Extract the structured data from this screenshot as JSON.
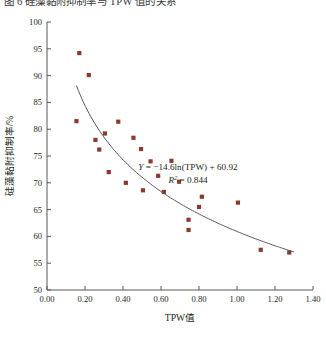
{
  "page": {
    "clipped_caption_above": "图 6 硅藻黏附抑制率与 TPW 值的关系"
  },
  "chart_data": {
    "type": "scatter",
    "title": "",
    "xlabel": "TPW值",
    "ylabel": "硅藻黏附抑制率/%",
    "xlim": [
      0.0,
      1.4
    ],
    "ylim": [
      50,
      100
    ],
    "xticks": [
      "0.00",
      "0.20",
      "0.40",
      "0.60",
      "0.80",
      "1.00",
      "1.20",
      "1.40"
    ],
    "xtick_values": [
      0.0,
      0.2,
      0.4,
      0.6,
      0.8,
      1.0,
      1.2,
      1.4
    ],
    "yticks": [
      "50",
      "55",
      "60",
      "65",
      "70",
      "75",
      "80",
      "85",
      "90",
      "95",
      "100"
    ],
    "ytick_values": [
      50,
      55,
      60,
      65,
      70,
      75,
      80,
      85,
      90,
      95,
      100
    ],
    "grid": false,
    "legend": null,
    "marker_color": "#8B3A2E",
    "marker_shape": "square",
    "curve_color": "#595959",
    "points": [
      {
        "x": 0.17,
        "y": 94.2
      },
      {
        "x": 0.22,
        "y": 90.1
      },
      {
        "x": 0.155,
        "y": 81.5
      },
      {
        "x": 0.375,
        "y": 81.4
      },
      {
        "x": 0.255,
        "y": 78.0
      },
      {
        "x": 0.305,
        "y": 79.2
      },
      {
        "x": 0.455,
        "y": 78.4
      },
      {
        "x": 0.275,
        "y": 76.2
      },
      {
        "x": 0.325,
        "y": 72.0
      },
      {
        "x": 0.495,
        "y": 76.3
      },
      {
        "x": 0.545,
        "y": 74.0
      },
      {
        "x": 0.415,
        "y": 70.0
      },
      {
        "x": 0.655,
        "y": 74.1
      },
      {
        "x": 0.585,
        "y": 71.3
      },
      {
        "x": 0.695,
        "y": 70.2
      },
      {
        "x": 0.505,
        "y": 68.6
      },
      {
        "x": 0.615,
        "y": 68.3
      },
      {
        "x": 0.815,
        "y": 67.4
      },
      {
        "x": 0.8,
        "y": 65.5
      },
      {
        "x": 1.005,
        "y": 66.3
      },
      {
        "x": 0.745,
        "y": 63.1
      },
      {
        "x": 0.745,
        "y": 61.2
      },
      {
        "x": 1.125,
        "y": 57.5
      },
      {
        "x": 1.275,
        "y": 57.0
      }
    ],
    "fit": {
      "equation_label": "Y = −14.6ln(TPW) + 60.92",
      "equation_y": "Y",
      "equation_body": " = −14.6ln(TPW) + 60.92",
      "r2_label": "R",
      "r2_sup": "2",
      "r2_value": " = 0.844",
      "slope": -14.6,
      "intercept": 60.92,
      "r_squared": 0.844,
      "x_range": [
        0.155,
        1.3
      ]
    }
  }
}
